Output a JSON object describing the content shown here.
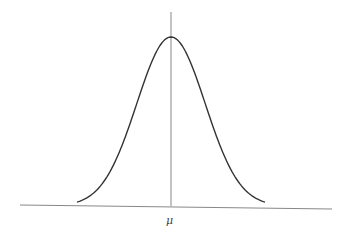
{
  "chart_data": {
    "type": "line",
    "xlabel": "",
    "ylabel": "",
    "tick_labels": [
      "μ"
    ],
    "annotations": [
      "μ"
    ],
    "mean_label": "μ",
    "curve": {
      "mean": 0,
      "sd": 1,
      "x_range": [
        -2.75,
        2.75
      ]
    },
    "grid": false,
    "legend": "none"
  },
  "colors": {
    "curve": "#333333",
    "axes": "#777777",
    "background": "#ffffff"
  }
}
